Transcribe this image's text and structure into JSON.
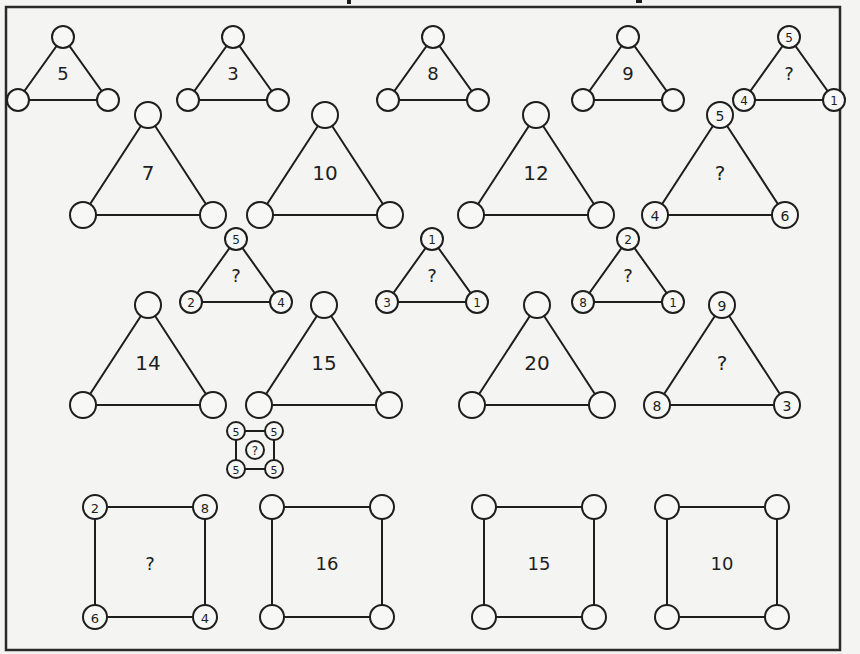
{
  "page": {
    "width": 860,
    "height": 654,
    "colors": {
      "background": "#f4f4f2",
      "ink": "#1e1e1e",
      "frame": "#2a2a2a"
    }
  },
  "frame": {
    "x": 6,
    "y": 7,
    "width": 834,
    "height": 643
  },
  "triangles": [
    {
      "id": "t-5",
      "cx": 63,
      "top": 37,
      "size": "small",
      "center": "5",
      "nodes": [
        "",
        "",
        ""
      ]
    },
    {
      "id": "t-3",
      "cx": 233,
      "top": 37,
      "size": "small",
      "center": "3",
      "nodes": [
        "",
        "",
        ""
      ]
    },
    {
      "id": "t-8",
      "cx": 433,
      "top": 37,
      "size": "small",
      "center": "8",
      "nodes": [
        "",
        "",
        ""
      ]
    },
    {
      "id": "t-9",
      "cx": 628,
      "top": 37,
      "size": "small",
      "center": "9",
      "nodes": [
        "",
        "",
        ""
      ]
    },
    {
      "id": "t-q1",
      "cx": 789,
      "top": 37,
      "size": "small",
      "center": "?",
      "nodes": [
        "5",
        "4",
        "1"
      ]
    },
    {
      "id": "t-7",
      "cx": 148,
      "top": 115,
      "size": "large",
      "center": "7",
      "nodes": [
        "",
        "",
        ""
      ]
    },
    {
      "id": "t-10",
      "cx": 325,
      "top": 115,
      "size": "large",
      "center": "10",
      "nodes": [
        "",
        "",
        ""
      ]
    },
    {
      "id": "t-12",
      "cx": 536,
      "top": 115,
      "size": "large",
      "center": "12",
      "nodes": [
        "",
        "",
        ""
      ]
    },
    {
      "id": "t-q2",
      "cx": 720,
      "top": 115,
      "size": "large",
      "center": "?",
      "nodes": [
        "5",
        "4",
        "6"
      ]
    },
    {
      "id": "t-q3",
      "cx": 236,
      "top": 239,
      "size": "small",
      "center": "?",
      "nodes": [
        "5",
        "2",
        "4"
      ]
    },
    {
      "id": "t-q4",
      "cx": 432,
      "top": 239,
      "size": "small",
      "center": "?",
      "nodes": [
        "1",
        "3",
        "1"
      ]
    },
    {
      "id": "t-q5",
      "cx": 628,
      "top": 239,
      "size": "small",
      "center": "?",
      "nodes": [
        "2",
        "8",
        "1"
      ]
    },
    {
      "id": "t-14",
      "cx": 148,
      "top": 305,
      "size": "large",
      "center": "14",
      "nodes": [
        "",
        "",
        ""
      ]
    },
    {
      "id": "t-15",
      "cx": 324,
      "top": 305,
      "size": "large",
      "center": "15",
      "nodes": [
        "",
        "",
        ""
      ]
    },
    {
      "id": "t-20",
      "cx": 537,
      "top": 305,
      "size": "large",
      "center": "20",
      "nodes": [
        "",
        "",
        ""
      ]
    },
    {
      "id": "t-q6",
      "cx": 722,
      "top": 305,
      "size": "large",
      "center": "?",
      "nodes": [
        "9",
        "8",
        "3"
      ]
    }
  ],
  "mini_square": {
    "id": "sq-mini",
    "x": 236,
    "y": 431,
    "center": "?",
    "nodes": [
      "5",
      "5",
      "5",
      "5"
    ]
  },
  "squares": [
    {
      "id": "sq-q",
      "x": 95,
      "y": 507,
      "center": "?",
      "nodes": [
        "2",
        "8",
        "6",
        "4"
      ]
    },
    {
      "id": "sq-16",
      "x": 272,
      "y": 507,
      "center": "16",
      "nodes": [
        "",
        "",
        "",
        ""
      ]
    },
    {
      "id": "sq-15",
      "x": 484,
      "y": 507,
      "center": "15",
      "nodes": [
        "",
        "",
        "",
        ""
      ]
    },
    {
      "id": "sq-10",
      "x": 667,
      "y": 507,
      "center": "10",
      "nodes": [
        "",
        "",
        "",
        ""
      ]
    }
  ],
  "geometry": {
    "small": {
      "half_base": 45,
      "height": 63,
      "r": 11,
      "font": 18,
      "node_font": 12
    },
    "large": {
      "half_base": 65,
      "height": 100,
      "r": 13,
      "font": 20,
      "node_font": 14
    },
    "square": {
      "side": 110,
      "r": 12,
      "font": 18,
      "node_font": 13
    },
    "mini": {
      "side": 38,
      "r": 9,
      "font": 12,
      "node_font": 11
    }
  }
}
